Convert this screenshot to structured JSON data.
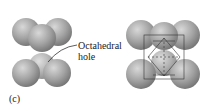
{
  "figure": {
    "label_text_1": "Octahedral",
    "label_text_2": "hole",
    "panel_label": "(c)",
    "sphere_color": "#9a9a9a"
  }
}
